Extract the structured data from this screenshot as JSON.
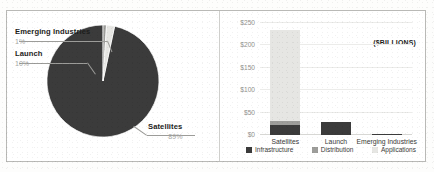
{
  "colors": {
    "infrastructure": "#3b3b3b",
    "distribution": "#9d9d9a",
    "applications": "#e6e6e3",
    "frame": "#b9b9b6",
    "grid": "#ececea",
    "leader": "#9c9c99",
    "pct_text": "#a6a6a3"
  },
  "pie_panel": {
    "callouts": [
      {
        "name": "Emerging Industries",
        "pct": "1%"
      },
      {
        "name": "Launch",
        "pct": "10%"
      },
      {
        "name": "Satellites",
        "pct": "89%"
      }
    ]
  },
  "bar_panel": {
    "units_note": "($BILLIONS)",
    "legend": [
      {
        "label": "Infrastructure",
        "color": "#3b3b3b"
      },
      {
        "label": "Distribution",
        "color": "#9d9d9a"
      },
      {
        "label": "Applications",
        "color": "#e6e6e3"
      }
    ]
  },
  "chart_data": [
    {
      "type": "pie",
      "title": "",
      "labels": [
        "Satellites",
        "Launch",
        "Emerging Industries"
      ],
      "values": [
        89,
        10,
        1
      ],
      "value_labels": [
        "89%",
        "10%",
        "1%"
      ],
      "unit": "percent",
      "colors": [
        "#3b3b3b",
        "#e6e6e3",
        "#9d9d9a"
      ],
      "legend": "callout labels with leader lines",
      "grid": false
    },
    {
      "type": "bar",
      "subtype": "stacked",
      "title": "",
      "annotation": "($BILLIONS)",
      "xlabel": "",
      "ylabel": "",
      "categories": [
        "Satellites",
        "Launch",
        "Emerging Industries"
      ],
      "series": [
        {
          "name": "Infrastructure",
          "color": "#3b3b3b",
          "values": [
            22,
            28,
            3
          ]
        },
        {
          "name": "Distribution",
          "color": "#9d9d9a",
          "values": [
            9,
            0,
            0
          ]
        },
        {
          "name": "Applications",
          "color": "#e6e6e3",
          "values": [
            204,
            0,
            0
          ]
        }
      ],
      "totals": [
        235,
        28,
        3
      ],
      "ylim": [
        0,
        250
      ],
      "ytick_values": [
        250,
        200,
        150,
        100,
        50,
        0
      ],
      "ytick_labels": [
        "$250",
        "$200",
        "$150",
        "$100",
        "$50",
        "$0"
      ],
      "grid": true,
      "legend_position": "bottom"
    }
  ]
}
